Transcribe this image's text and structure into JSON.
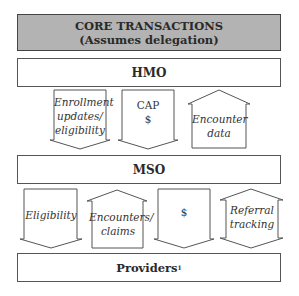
{
  "header": {
    "line1": "CORE TRANSACTIONS",
    "line2": "(Assumes delegation)",
    "bg_color": "#b3b3b3"
  },
  "entities": {
    "hmo": "HMO",
    "mso": "MSO",
    "providers": "Providers",
    "providers_footnote": "1"
  },
  "hmo_mso_flows": [
    {
      "label_lines": [
        "Enrollment",
        "updates/",
        "eligibility"
      ],
      "direction": "down"
    },
    {
      "label_lines": [
        "CAP",
        "$"
      ],
      "direction": "down"
    },
    {
      "label_lines": [
        "Encounter",
        "data"
      ],
      "direction": "up"
    }
  ],
  "mso_provider_flows": [
    {
      "label_lines": [
        "Eligibility"
      ],
      "direction": "down"
    },
    {
      "label_lines": [
        "Encounters/",
        "claims"
      ],
      "direction": "up"
    },
    {
      "label_lines": [
        "$"
      ],
      "direction": "down"
    },
    {
      "label_lines": [
        "Referral",
        "tracking"
      ],
      "direction": "both"
    }
  ]
}
